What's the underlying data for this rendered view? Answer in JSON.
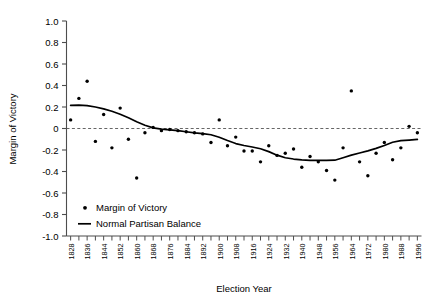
{
  "chart_data": {
    "type": "scatter",
    "title": "",
    "xlabel": "Election Year",
    "ylabel": "Margin of Victory",
    "xlim": [
      1826,
      1998
    ],
    "ylim": [
      -1.0,
      1.0
    ],
    "grid": false,
    "zero_reference_line": 0,
    "legend_position": "lower-left-inside",
    "y_ticks": [
      "1.0",
      "0.8",
      "0.6",
      "0.4",
      "0.2",
      "0",
      "-0.2",
      "-0.4",
      "-0.6",
      "-0.8",
      "-1.0"
    ],
    "y_tick_values": [
      1.0,
      0.8,
      0.6,
      0.4,
      0.2,
      0,
      -0.2,
      -0.4,
      -0.6,
      -0.8,
      -1.0
    ],
    "x_tick_labels": [
      "1828",
      "1836",
      "1844",
      "1852",
      "1860",
      "1868",
      "1876",
      "1884",
      "1892",
      "1900",
      "1908",
      "1916",
      "1924",
      "1932",
      "1940",
      "1948",
      "1956",
      "1964",
      "1972",
      "1980",
      "1988",
      "1996"
    ],
    "x_tick_values": [
      1828,
      1836,
      1844,
      1852,
      1860,
      1868,
      1876,
      1884,
      1892,
      1900,
      1908,
      1916,
      1924,
      1932,
      1940,
      1948,
      1956,
      1964,
      1972,
      1980,
      1988,
      1996
    ],
    "x_minor_tick_values": [
      1832,
      1840,
      1848,
      1856,
      1864,
      1872,
      1880,
      1888,
      1896,
      1904,
      1912,
      1920,
      1928,
      1936,
      1944,
      1952,
      1960,
      1968,
      1976,
      1984,
      1992
    ],
    "series": [
      {
        "name": "Margin of Victory",
        "type": "scatter",
        "marker": "dot",
        "color": "#000000",
        "x": [
          1828,
          1832,
          1836,
          1840,
          1844,
          1848,
          1852,
          1856,
          1860,
          1864,
          1868,
          1872,
          1876,
          1880,
          1884,
          1888,
          1892,
          1896,
          1900,
          1904,
          1908,
          1912,
          1916,
          1920,
          1924,
          1928,
          1932,
          1936,
          1940,
          1944,
          1948,
          1952,
          1956,
          1960,
          1964,
          1968,
          1972,
          1976,
          1980,
          1984,
          1988,
          1992,
          1996
        ],
        "y": [
          0.08,
          0.28,
          0.44,
          -0.12,
          0.13,
          -0.18,
          0.19,
          -0.1,
          -0.46,
          -0.04,
          0.01,
          -0.02,
          -0.01,
          -0.02,
          -0.03,
          -0.04,
          -0.05,
          -0.13,
          0.08,
          -0.16,
          -0.08,
          -0.21,
          -0.21,
          -0.31,
          -0.16,
          -0.25,
          -0.23,
          -0.19,
          -0.36,
          -0.26,
          -0.31,
          -0.39,
          -0.48,
          -0.18,
          0.35,
          -0.31,
          -0.44,
          -0.23,
          -0.13,
          -0.29,
          -0.18,
          0.02,
          -0.04
        ]
      },
      {
        "name": "Normal Partisan Balance",
        "type": "line",
        "color": "#000000",
        "x": [
          1828,
          1832,
          1836,
          1840,
          1844,
          1848,
          1852,
          1856,
          1860,
          1864,
          1868,
          1872,
          1876,
          1880,
          1884,
          1888,
          1892,
          1896,
          1900,
          1904,
          1908,
          1912,
          1916,
          1920,
          1924,
          1928,
          1932,
          1936,
          1940,
          1944,
          1948,
          1952,
          1956,
          1960,
          1964,
          1968,
          1972,
          1976,
          1980,
          1984,
          1988,
          1992,
          1996
        ],
        "y": [
          0.215,
          0.218,
          0.213,
          0.2,
          0.182,
          0.16,
          0.133,
          0.1,
          0.062,
          0.03,
          0.006,
          -0.006,
          -0.012,
          -0.02,
          -0.03,
          -0.04,
          -0.048,
          -0.058,
          -0.082,
          -0.112,
          -0.14,
          -0.158,
          -0.172,
          -0.188,
          -0.215,
          -0.248,
          -0.272,
          -0.284,
          -0.292,
          -0.296,
          -0.297,
          -0.296,
          -0.295,
          -0.272,
          -0.248,
          -0.228,
          -0.208,
          -0.185,
          -0.158,
          -0.128,
          -0.113,
          -0.108,
          -0.102
        ]
      }
    ],
    "legend": [
      {
        "label": "Margin of Victory",
        "marker": "dot",
        "color": "#000000"
      },
      {
        "label": "Normal Partisan Balance",
        "marker": "line",
        "color": "#000000"
      }
    ]
  },
  "axes": {
    "y_axis_title": "Margin of Victory",
    "x_axis_title": "Election Year"
  },
  "colors": {
    "ink": "#000000",
    "background": "#ffffff",
    "axis": "#4d4d4d",
    "reference_line": "#555555"
  }
}
